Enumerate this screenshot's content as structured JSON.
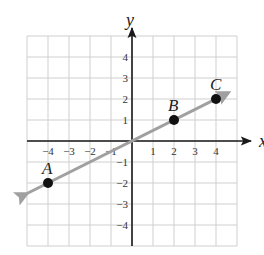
{
  "chart_data": {
    "type": "line",
    "title": "",
    "xlabel": "x",
    "ylabel": "y",
    "xlim": [
      -5,
      5
    ],
    "ylim": [
      -5,
      5
    ],
    "grid": true,
    "x_ticks": [
      -4,
      -3,
      -2,
      -1,
      1,
      2,
      3,
      4
    ],
    "y_ticks": [
      4,
      3,
      2,
      1,
      -1,
      -2,
      -3,
      -4
    ],
    "x_tick_labels": [
      "−4",
      "−3",
      "−2",
      "−1",
      "1",
      "2",
      "3",
      "4"
    ],
    "y_tick_labels": [
      "4",
      "3",
      "2",
      "1",
      "−1",
      "−2",
      "−3",
      "−4"
    ],
    "line": {
      "equation": "y = x/2",
      "slope": 0.5,
      "intercept": 0,
      "x_start": -5,
      "x_end": 4.6,
      "arrows": "both",
      "color": "#a0a0a0"
    },
    "points": [
      {
        "label": "A",
        "x": -4,
        "y": -2
      },
      {
        "label": "B",
        "x": 2,
        "y": 1
      },
      {
        "label": "C",
        "x": 4,
        "y": 2
      }
    ],
    "colors": {
      "grid": "#cfcfcf",
      "axis": "#1a1a1a",
      "point": "#111111"
    }
  }
}
